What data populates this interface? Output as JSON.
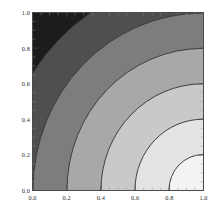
{
  "figure": {
    "kind": "contour-plot",
    "background": "#ffffff",
    "frame_color": "#4a4a4a"
  },
  "chart_data": {
    "type": "heatmap",
    "title": "",
    "subtitle": "",
    "xlabel": "",
    "ylabel": "",
    "xlim": [
      0.0,
      1.0
    ],
    "ylim": [
      0.0,
      1.0
    ],
    "grid": false,
    "legend": "none",
    "center": [
      1.0,
      0.0
    ],
    "function": "sqrt((x-1)^2 + y^2)",
    "contour_levels": [
      0.2,
      0.4,
      0.6,
      0.8,
      1.0,
      1.2
    ],
    "contour_line_color": "#3a3a3a",
    "bands": [
      {
        "range": [
          0.0,
          0.2
        ],
        "fill": "#f3f3f3"
      },
      {
        "range": [
          0.2,
          0.4
        ],
        "fill": "#e3e3e3"
      },
      {
        "range": [
          0.4,
          0.6
        ],
        "fill": "#c9c9c9"
      },
      {
        "range": [
          0.6,
          0.8
        ],
        "fill": "#a8a8a8"
      },
      {
        "range": [
          0.8,
          1.0
        ],
        "fill": "#7d7d7d"
      },
      {
        "range": [
          1.0,
          1.2
        ],
        "fill": "#4f4f4f"
      },
      {
        "range": [
          1.2,
          1.5
        ],
        "fill": "#1c1c1c"
      }
    ],
    "x_ticks": [
      {
        "value": 0.0,
        "label": "0.0"
      },
      {
        "value": 0.2,
        "label": "0.2"
      },
      {
        "value": 0.4,
        "label": "0.4"
      },
      {
        "value": 0.6,
        "label": "0.6"
      },
      {
        "value": 0.8,
        "label": "0.8"
      },
      {
        "value": 1.0,
        "label": "1.0"
      }
    ],
    "y_ticks": [
      {
        "value": 0.0,
        "label": "0.0"
      },
      {
        "value": 0.2,
        "label": "0.2"
      },
      {
        "value": 0.4,
        "label": "0.4"
      },
      {
        "value": 0.6,
        "label": "0.6"
      },
      {
        "value": 0.8,
        "label": "0.8"
      },
      {
        "value": 1.0,
        "label": "1.0"
      }
    ]
  }
}
